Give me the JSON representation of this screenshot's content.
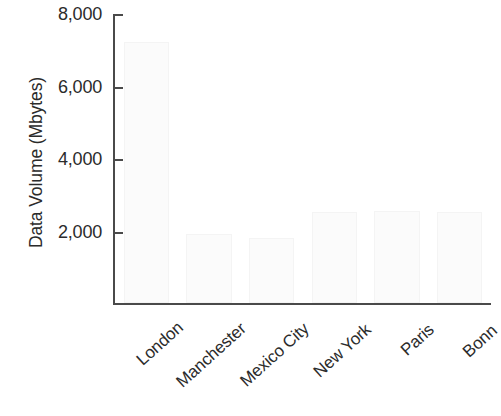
{
  "chart_data": {
    "type": "bar",
    "title": "",
    "subtitle": "",
    "xlabel": "",
    "ylabel": "Data Volume (Mbytes)",
    "categories": [
      "London",
      "Manchester",
      "Mexico City",
      "New York",
      "Paris",
      "Bonn"
    ],
    "values": [
      7200,
      1900,
      1800,
      2500,
      2550,
      2500
    ],
    "ylim": [
      0,
      8000
    ],
    "yticks": [
      0,
      2000,
      4000,
      6000,
      8000
    ],
    "ytick_labels": [
      "",
      "2,000",
      "4,000",
      "6,000",
      "8,000"
    ],
    "grid": false,
    "legend": false,
    "legend_position": "none",
    "bar_color": "#fbfbfb",
    "axis_color": "#4a4a4a",
    "text_color": "#2b2b2b"
  },
  "axis": {
    "y_title": "Data Volume (Mbytes)",
    "ticks": [
      {
        "label": "8,000",
        "value": 8000
      },
      {
        "label": "6,000",
        "value": 6000
      },
      {
        "label": "4,000",
        "value": 4000
      },
      {
        "label": "2,000",
        "value": 2000
      }
    ]
  },
  "categories": [
    {
      "label": "London"
    },
    {
      "label": "Manchester"
    },
    {
      "label": "Mexico City"
    },
    {
      "label": "New York"
    },
    {
      "label": "Paris"
    },
    {
      "label": "Bonn"
    }
  ]
}
